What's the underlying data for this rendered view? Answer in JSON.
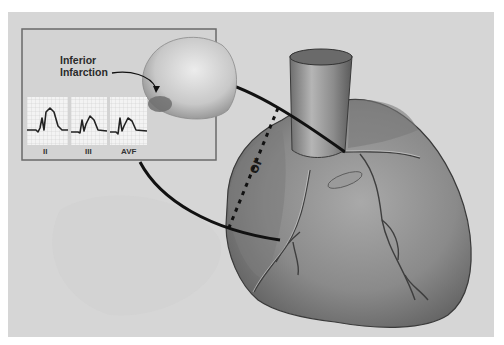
{
  "figure": {
    "inset": {
      "callout_lines": [
        "Inferior",
        "Infarction"
      ],
      "ecg_leads": [
        {
          "label": "II"
        },
        {
          "label": "III"
        },
        {
          "label": "AVF"
        }
      ],
      "finding": "ST elevation"
    },
    "main": {
      "connector_label": "or"
    },
    "colors": {
      "plate": "#d6d6d6",
      "inset_border": "#6a6a6a",
      "heart_fill": "#8e8e8e",
      "line": "#111111",
      "ecg_grid": "#f2f2f2"
    }
  }
}
